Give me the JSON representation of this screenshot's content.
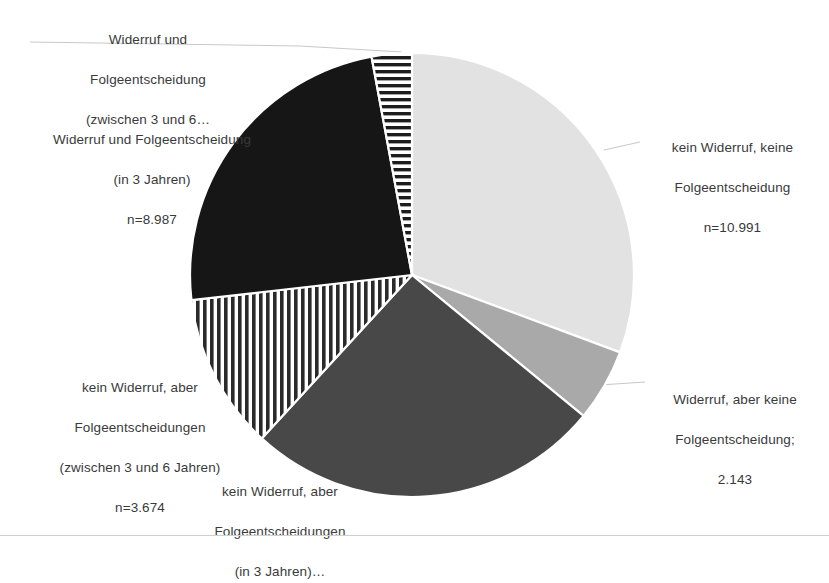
{
  "chart_data": {
    "type": "pie",
    "title": "",
    "subtitle": "",
    "xlabel": "",
    "ylabel": "",
    "legend_position": "none",
    "grid": false,
    "total": 36786,
    "center": {
      "x": 412,
      "y": 275
    },
    "radius": 222,
    "categories": [
      "kein Widerruf, keine Folgeentscheidung",
      "Widerruf, aber keine Folgeentscheidung",
      "kein Widerruf, aber Folgeentscheidungen (in 3 Jahren)",
      "kein Widerruf, aber Folgeentscheidungen (zwischen 3 und 6 Jahren)",
      "Widerruf und Folgeentscheidung (in 3 Jahren)",
      "Widerruf und Folgeentscheidung (zwischen 3 und 6 Jahren)"
    ],
    "values": [
      10991,
      2143,
      10450,
      3674,
      8987,
      1100
    ],
    "slices": [
      {
        "id": "kein-widerruf-keine",
        "label": "kein Widerruf, keine Folgeentscheidung",
        "value": 10991,
        "value_text": "n=10.991",
        "start_angle": 0,
        "end_angle": 110.4,
        "fill_kind": "solid",
        "color": "#e2e2e2"
      },
      {
        "id": "widerruf-keine",
        "label": "Widerruf, aber keine Folgeentscheidung",
        "value": 2143,
        "value_text": "2.143",
        "start_angle": 110.4,
        "end_angle": 129.4,
        "fill_kind": "solid",
        "color": "#a9a9a9"
      },
      {
        "id": "kein-widerruf-3",
        "label": "kein Widerruf, aber Folgeentscheidungen (in 3 Jahren)",
        "value": 10450,
        "value_text": "",
        "start_angle": 129.4,
        "end_angle": 222.6,
        "fill_kind": "solid",
        "color": "#484848"
      },
      {
        "id": "kein-widerruf-3-6",
        "label": "kein Widerruf, aber Folgeentscheidungen (zwischen 3 und 6 Jahren)",
        "value": 3674,
        "value_text": "n=3.674",
        "start_angle": 222.6,
        "end_angle": 263.5,
        "fill_kind": "vertical-stripes",
        "color": "#2a2a2a"
      },
      {
        "id": "widerruf-folge-3",
        "label": "Widerruf und Folgeentscheidung (in 3 Jahren)",
        "value": 8987,
        "value_text": "n=8.987",
        "start_angle": 263.5,
        "end_angle": 349.5,
        "fill_kind": "solid",
        "color": "#161616"
      },
      {
        "id": "widerruf-folge-3-6",
        "label": "Widerruf und Folgeentscheidung (zwischen 3 und 6 Jahren)",
        "value": 1100,
        "value_text": "",
        "start_angle": 349.5,
        "end_angle": 360,
        "fill_kind": "horizontal-stripes",
        "color": "#1d1d1d"
      }
    ]
  },
  "labels": {
    "widerruf_folge_3_6": {
      "line1": "Widerruf und",
      "line2": "Folgeentscheidung",
      "line3": "(zwischen 3 und 6…"
    },
    "widerruf_folge_3": {
      "line1": "Widerruf und Folgeentscheidung",
      "line2": "(in 3 Jahren)",
      "line3": "n=8.987"
    },
    "kein_widerruf_keine": {
      "line1": "kein Widerruf, keine",
      "line2": "Folgeentscheidung",
      "line3": "n=10.991"
    },
    "widerruf_keine": {
      "line1": "Widerruf, aber keine",
      "line2": "Folgeentscheidung;",
      "line3": "2.143"
    },
    "kein_widerruf_3_6": {
      "line1": "kein Widerruf, aber",
      "line2": "Folgeentscheidungen",
      "line3": "(zwischen 3 und 6 Jahren)",
      "line4": "n=3.674"
    },
    "kein_widerruf_3": {
      "line1": "kein Widerruf, aber",
      "line2": "Folgeentscheidungen",
      "line3": "(in 3 Jahren)…"
    }
  },
  "colors": {
    "background": "#ffffff",
    "text": "#3a3a3a",
    "leader_line": "#c8c8c8",
    "slice_gap": "#ffffff"
  }
}
